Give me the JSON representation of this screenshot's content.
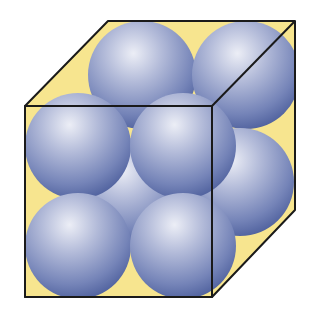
{
  "diagram": {
    "type": "unit-cell",
    "colors": {
      "background": "#ffffff",
      "cell_fill": "#f7e58f",
      "edge": "#1a1a1a",
      "sphere_light": "#e6e8f2",
      "sphere_mid": "#8f9cc6",
      "sphere_dark": "#4a5c9a"
    },
    "cube": {
      "back_top_left": [
        108,
        21
      ],
      "back_top_right": [
        295,
        21
      ],
      "back_bottom_right": [
        295,
        210
      ],
      "front_top_left": [
        25,
        106
      ],
      "front_top_right": [
        212,
        106
      ],
      "front_bottom_right": [
        212,
        297
      ],
      "front_bottom_left": [
        25,
        297
      ]
    },
    "spheres": [
      {
        "name": "back-top-left",
        "cx": 142,
        "cy": 75,
        "r": 54
      },
      {
        "name": "back-top-right",
        "cx": 246,
        "cy": 75,
        "r": 54
      },
      {
        "name": "center-back",
        "cx": 131,
        "cy": 192,
        "r": 54
      },
      {
        "name": "right-face-center",
        "cx": 240,
        "cy": 182,
        "r": 54
      },
      {
        "name": "front-top-left",
        "cx": 78,
        "cy": 146,
        "r": 53
      },
      {
        "name": "front-top-right",
        "cx": 183,
        "cy": 146,
        "r": 53
      },
      {
        "name": "front-bottom-left",
        "cx": 78,
        "cy": 246,
        "r": 53
      },
      {
        "name": "front-bottom-right",
        "cx": 183,
        "cy": 246,
        "r": 53
      }
    ]
  }
}
